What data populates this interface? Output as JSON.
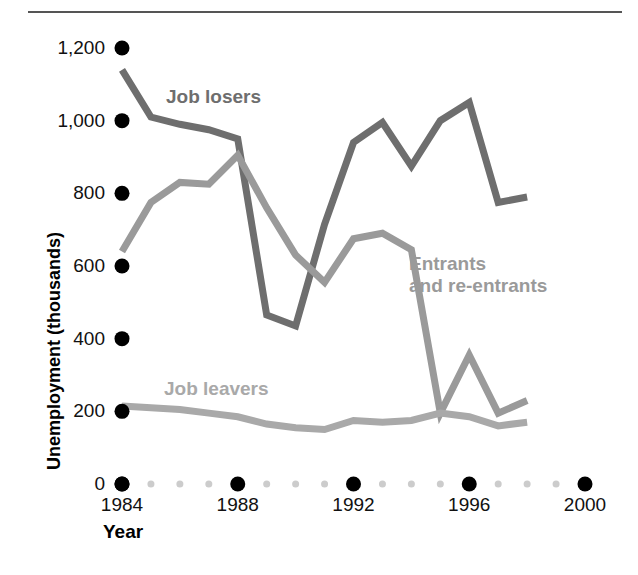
{
  "chart_data": {
    "type": "line",
    "title": "",
    "xlabel": "Year",
    "ylabel": "Unemployment (thousands)",
    "xlim": [
      1984,
      2000
    ],
    "ylim": [
      0,
      1200
    ],
    "yticks": [
      0,
      200,
      400,
      600,
      800,
      1000,
      1200
    ],
    "ytick_labels": [
      "0",
      "200",
      "400",
      "600",
      "800",
      "1,000",
      "1,200"
    ],
    "xticks": [
      1984,
      1988,
      1992,
      1996,
      2000
    ],
    "xtick_labels": [
      "1984",
      "1988",
      "1992",
      "1996",
      "2000"
    ],
    "x_minor_ticks": [
      1985,
      1986,
      1987,
      1989,
      1990,
      1991,
      1993,
      1994,
      1995,
      1997,
      1998,
      1999
    ],
    "grid": false,
    "legend_position": "inline-annotations",
    "x": [
      1984,
      1985,
      1986,
      1987,
      1988,
      1989,
      1990,
      1991,
      1992,
      1993,
      1994,
      1995,
      1996,
      1997,
      1998
    ],
    "series": [
      {
        "name": "Job losers",
        "color": "#6e6e6e",
        "label_text": "Job losers",
        "values": [
          1140,
          1010,
          990,
          975,
          950,
          465,
          435,
          715,
          940,
          995,
          875,
          1000,
          1050,
          775,
          790
        ]
      },
      {
        "name": "Entrants and re-entrants",
        "color": "#9a9a9a",
        "label_text": "Entrants\nand re-entrants",
        "values": [
          640,
          775,
          830,
          825,
          905,
          760,
          630,
          555,
          675,
          690,
          645,
          195,
          355,
          195,
          230
        ]
      },
      {
        "name": "Job leavers",
        "color": "#a9a9a9",
        "label_text": "Job leavers",
        "values": [
          215,
          210,
          205,
          195,
          185,
          165,
          155,
          150,
          175,
          170,
          175,
          195,
          185,
          160,
          170
        ]
      }
    ],
    "annotations": [
      {
        "text": "Job losers",
        "x": 1985.5,
        "y": 1075
      },
      {
        "text": "Entrants and re-entrants",
        "x": 1993.9,
        "y": 605
      },
      {
        "text": "Job leavers",
        "x": 1985.4,
        "y": 270
      }
    ]
  },
  "axes": {
    "y_title": "Unemployment (thousands)",
    "x_title": "Year",
    "tick_dot_color": "#000000",
    "minor_dot_color": "#cccccc"
  },
  "figure": {
    "background": "#ffffff",
    "rule_color": "#555555"
  }
}
